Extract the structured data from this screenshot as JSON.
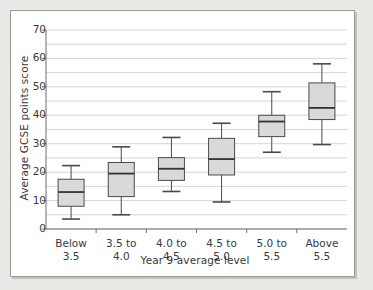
{
  "chart_data": {
    "type": "box",
    "title": "",
    "xlabel": "Year 9 average level",
    "ylabel": "Average GCSE points score",
    "categories": [
      "Below 3.5",
      "3.5 to 4.0",
      "4.0 to 4.5",
      "4.5 to 5.0",
      "5.0 to 5.5",
      "Above 5.5"
    ],
    "category_lines": [
      [
        "Below",
        "3.5"
      ],
      [
        "3.5 to",
        "4.0"
      ],
      [
        "4.0 to",
        "4.5"
      ],
      [
        "4.5 to",
        "5.0"
      ],
      [
        "5.0 to",
        "5.5"
      ],
      [
        "Above",
        "5.5"
      ]
    ],
    "ylim": [
      0,
      70
    ],
    "ytick_labels": [
      "0",
      "10",
      "20",
      "30",
      "40",
      "50",
      "60",
      "70"
    ],
    "ytick_values": [
      0,
      10,
      20,
      30,
      40,
      50,
      60,
      70
    ],
    "minor_gridline_step": 5,
    "grid": true,
    "legend": "none",
    "boxes": [
      {
        "category": "Below 3.5",
        "whisker_low": 3.5,
        "q1": 8.0,
        "median": 13.0,
        "q3": 17.5,
        "whisker_high": 22.3
      },
      {
        "category": "3.5 to 4.0",
        "whisker_low": 5.0,
        "q1": 11.4,
        "median": 19.5,
        "q3": 23.4,
        "whisker_high": 28.9
      },
      {
        "category": "4.0 to 4.5",
        "whisker_low": 13.2,
        "q1": 17.1,
        "median": 21.2,
        "q3": 25.1,
        "whisker_high": 32.2
      },
      {
        "category": "4.5 to 5.0",
        "whisker_low": 9.5,
        "q1": 19.0,
        "median": 24.6,
        "q3": 31.9,
        "whisker_high": 37.2
      },
      {
        "category": "5.0 to 5.5",
        "whisker_low": 27.0,
        "q1": 32.5,
        "median": 37.8,
        "q3": 40.0,
        "whisker_high": 48.3
      },
      {
        "category": "Above 5.5",
        "whisker_low": 29.7,
        "q1": 38.5,
        "median": 42.6,
        "q3": 51.4,
        "whisker_high": 58.1
      }
    ],
    "colors": {
      "box_fill": "#d9d9d9",
      "box_edge": "#4a4a4a",
      "median": "#333333",
      "whisker": "#4a4a4a",
      "grid": "#d6d6d6",
      "axis": "#6f6f6f",
      "plot_background": "#ffffff",
      "page_background": "#e9e8e4",
      "text": "#3a3a3a"
    }
  }
}
